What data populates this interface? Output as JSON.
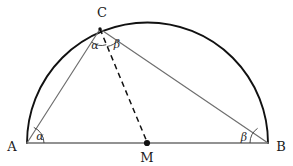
{
  "figure": {
    "width": 293,
    "height": 166,
    "background": "#ffffff"
  },
  "colors": {
    "arc": "#111111",
    "triangle": "#6f6f6f",
    "baseline": "#6f6f6f",
    "median_dashed": "#111111",
    "point_dot": "#111111",
    "angle_arc": "#3a3a3a",
    "label_text": "#1a1a1a"
  },
  "points": {
    "A": {
      "label": "A",
      "x": 27,
      "y": 143,
      "label_x": 12,
      "label_y": 146
    },
    "B": {
      "label": "B",
      "x": 268,
      "y": 143,
      "label_x": 281,
      "label_y": 146
    },
    "C": {
      "label": "C",
      "x": 100,
      "y": 29,
      "label_x": 102,
      "label_y": 12
    },
    "M": {
      "label": "M",
      "x": 147,
      "y": 143,
      "label_x": 147,
      "label_y": 157
    }
  },
  "circle": {
    "center_x": 147.5,
    "center_y": 143,
    "radius": 120.5,
    "apex_y": 22.5
  },
  "segments": [
    {
      "name": "diameter-AB",
      "from": "A",
      "to": "B",
      "style": "solid",
      "color": "#6f6f6f",
      "width": 1.2
    },
    {
      "name": "side-AC",
      "from": "A",
      "to": "C",
      "style": "solid",
      "color": "#6f6f6f",
      "width": 1.2
    },
    {
      "name": "side-CB",
      "from": "C",
      "to": "B",
      "style": "solid",
      "color": "#6f6f6f",
      "width": 1.2
    },
    {
      "name": "median-CM",
      "from": "C",
      "to": "M",
      "style": "dashed",
      "color": "#111111",
      "width": 1.4
    }
  ],
  "angles": [
    {
      "name": "alpha-at-A",
      "symbol": "α",
      "vertex": "A",
      "label_x": 40,
      "label_y": 136
    },
    {
      "name": "alpha-at-C",
      "symbol": "α",
      "vertex": "C",
      "label_x": 95,
      "label_y": 45
    },
    {
      "name": "beta-at-C",
      "symbol": "β",
      "vertex": "C",
      "label_x": 117,
      "label_y": 44
    },
    {
      "name": "beta-at-B",
      "symbol": "β",
      "vertex": "B",
      "label_x": 244,
      "label_y": 137
    }
  ]
}
